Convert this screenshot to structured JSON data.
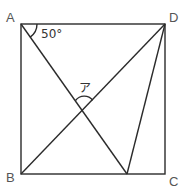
{
  "diagram": {
    "type": "geometry",
    "shape": "square",
    "vertices": [
      {
        "name": "A",
        "label": "A",
        "x": 21,
        "y": 24
      },
      {
        "name": "D",
        "label": "D",
        "x": 165,
        "y": 24
      },
      {
        "name": "B",
        "label": "B",
        "x": 21,
        "y": 174
      },
      {
        "name": "C",
        "label": "C",
        "x": 165,
        "y": 174
      }
    ],
    "point_on_bc": {
      "x": 127,
      "y": 174
    },
    "segments": [
      "AB",
      "BC",
      "CD",
      "DA",
      "A-E",
      "D-E",
      "BD"
    ],
    "angle_at_a": {
      "label": "50°"
    },
    "angle_unknown": {
      "label": "ア"
    },
    "line_color": "#2b2b2b",
    "label_color": "#555555"
  }
}
